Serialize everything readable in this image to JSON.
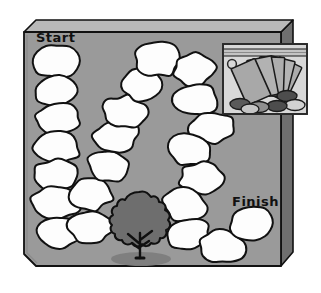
{
  "scene": {
    "type": "board-game-track",
    "title": "Blank board game track with Start and Finish",
    "width": 321,
    "height": 293
  },
  "colors": {
    "page_background": "#ffffff",
    "board_face": "#9a9a9a",
    "board_top_edge": "#b9b9b9",
    "board_side_edge": "#6f6f6f",
    "board_outline": "#111111",
    "space_fill": "#fdfdfd",
    "space_outline": "#111111",
    "tree_foliage": "#6e6e6e",
    "tree_outline": "#101010",
    "tree_shadow": "#7d7d7d",
    "bag_plastic": "#d8d8d8",
    "bag_outline": "#2a2a2a",
    "card_fill": "#acacac",
    "card_outline": "#1a1a1a",
    "token_dark": "#4d4d4d",
    "token_mid": "#8f8f8f",
    "token_light": "#d2d2d2",
    "label_text": "#111111"
  },
  "board": {
    "start_label": "Start",
    "finish_label": "Finish",
    "space_count": 26,
    "spaces": [
      {
        "index": 1,
        "cx": 56,
        "cy": 62,
        "rx": 23,
        "ry": 16,
        "rot": -3,
        "segment": "left-column"
      },
      {
        "index": 2,
        "cx": 56,
        "cy": 91,
        "rx": 23,
        "ry": 15,
        "rot": 2,
        "segment": "left-column"
      },
      {
        "index": 3,
        "cx": 57,
        "cy": 118,
        "rx": 23,
        "ry": 15,
        "rot": -2,
        "segment": "left-column"
      },
      {
        "index": 4,
        "cx": 57,
        "cy": 146,
        "rx": 23,
        "ry": 16,
        "rot": 4,
        "segment": "left-column"
      },
      {
        "index": 5,
        "cx": 56,
        "cy": 175,
        "rx": 23,
        "ry": 15,
        "rot": -4,
        "segment": "left-column"
      },
      {
        "index": 6,
        "cx": 56,
        "cy": 203,
        "rx": 24,
        "ry": 16,
        "rot": 3,
        "segment": "left-column"
      },
      {
        "index": 7,
        "cx": 59,
        "cy": 233,
        "rx": 23,
        "ry": 16,
        "rot": -2,
        "segment": "left-column"
      },
      {
        "index": 8,
        "cx": 90,
        "cy": 227,
        "rx": 22,
        "ry": 16,
        "rot": 8,
        "segment": "diagonal-up"
      },
      {
        "index": 9,
        "cx": 91,
        "cy": 194,
        "rx": 22,
        "ry": 16,
        "rot": -6,
        "segment": "diagonal-up"
      },
      {
        "index": 10,
        "cx": 109,
        "cy": 166,
        "rx": 22,
        "ry": 16,
        "rot": 10,
        "segment": "diagonal-up"
      },
      {
        "index": 11,
        "cx": 116,
        "cy": 136,
        "rx": 22,
        "ry": 16,
        "rot": -8,
        "segment": "diagonal-up"
      },
      {
        "index": 12,
        "cx": 124,
        "cy": 112,
        "rx": 22,
        "ry": 16,
        "rot": 5,
        "segment": "diagonal-up"
      },
      {
        "index": 13,
        "cx": 142,
        "cy": 84,
        "rx": 22,
        "ry": 16,
        "rot": -7,
        "segment": "diagonal-up"
      },
      {
        "index": 14,
        "cx": 158,
        "cy": 59,
        "rx": 23,
        "ry": 17,
        "rot": 6,
        "segment": "top-turn"
      },
      {
        "index": 15,
        "cx": 195,
        "cy": 69,
        "rx": 22,
        "ry": 16,
        "rot": -5,
        "segment": "right-column"
      },
      {
        "index": 16,
        "cx": 196,
        "cy": 100,
        "rx": 22,
        "ry": 16,
        "rot": 4,
        "segment": "right-column"
      },
      {
        "index": 17,
        "cx": 211,
        "cy": 128,
        "rx": 22,
        "ry": 16,
        "rot": -6,
        "segment": "right-column"
      },
      {
        "index": 18,
        "cx": 190,
        "cy": 150,
        "rx": 22,
        "ry": 16,
        "rot": 7,
        "segment": "right-column"
      },
      {
        "index": 19,
        "cx": 202,
        "cy": 178,
        "rx": 22,
        "ry": 16,
        "rot": -4,
        "segment": "right-column"
      },
      {
        "index": 20,
        "cx": 184,
        "cy": 205,
        "rx": 22,
        "ry": 16,
        "rot": 6,
        "segment": "right-column"
      },
      {
        "index": 21,
        "cx": 188,
        "cy": 234,
        "rx": 22,
        "ry": 16,
        "rot": -5,
        "segment": "right-column"
      },
      {
        "index": 22,
        "cx": 222,
        "cy": 247,
        "rx": 22,
        "ry": 16,
        "rot": 8,
        "segment": "finish-run"
      },
      {
        "index": 23,
        "cx": 252,
        "cy": 224,
        "rx": 22,
        "ry": 16,
        "rot": -3,
        "segment": "finish-run"
      },
      {
        "index": 24,
        "cx": 172,
        "cy": 106,
        "rx": 0,
        "ry": 0,
        "rot": 0,
        "segment": "unused"
      },
      {
        "index": 25,
        "cx": 0,
        "cy": 0,
        "rx": 0,
        "ry": 0,
        "rot": 0,
        "segment": "unused"
      },
      {
        "index": 26,
        "cx": 0,
        "cy": 0,
        "rx": 0,
        "ry": 0,
        "rot": 0,
        "segment": "unused"
      }
    ]
  },
  "decorations": {
    "tree": {
      "name": "tree",
      "x": 108,
      "y": 190,
      "width": 62,
      "height": 70
    },
    "tree_shadow": {
      "name": "tree-shadow",
      "cx": 140,
      "cy": 258,
      "rx": 30,
      "ry": 7
    },
    "bag": {
      "name": "ziplock-bag-of-cards",
      "x": 222,
      "y": 43,
      "width": 85,
      "height": 72,
      "card_count": 5,
      "token_count": 6,
      "has_zip_seal": true,
      "has_hang_hole": true
    }
  }
}
